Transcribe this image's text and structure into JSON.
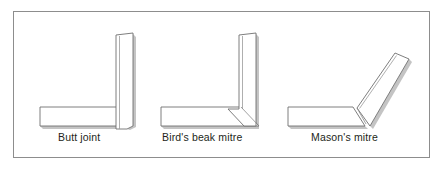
{
  "figure": {
    "background_color": "#ffffff",
    "frame": {
      "name": "figure-border",
      "stroke_color": "#8d8d8d",
      "fill_color": "#ffffff"
    },
    "line_color": "#6f6f6f",
    "shadow_color": "#b8b8b8",
    "shape_fill": "#ffffff",
    "diagrams": [
      {
        "id": "butt-joint",
        "label": "Butt joint",
        "description": "Two rectangular sections meeting at a right angle with square-cut ends",
        "pieces": [
          {
            "name": "horizontal-member",
            "outline": "40,107 117,107 117,126 40,126"
          },
          {
            "name": "vertical-member",
            "outline": "116,35 133,33 133,126 127,129 116,129"
          }
        ]
      },
      {
        "id": "birds-beak-mitre",
        "label": "Bird's beak mitre",
        "description": "Horizontal member cut at 45 degrees meeting a vertical member with a notched beak",
        "pieces": [
          {
            "name": "horizontal-member",
            "outline": "161,107 241,107 259,126 161,126"
          },
          {
            "name": "vertical-member",
            "outline": "239,35 256,33 256,126 244,126 228,109 239,109"
          }
        ]
      },
      {
        "id": "masons-mitre",
        "label": "Mason's mitre",
        "description": "Horizontal member joined to an inclined member at an obtuse angle with a short mitre cut",
        "pieces": [
          {
            "name": "horizontal-member",
            "outline": "288,107 353,107 365,126 288,126"
          },
          {
            "name": "inclined-member",
            "outline": "357,108 395,53 409,59 370,126"
          }
        ]
      }
    ]
  },
  "labels": {
    "butt_joint": "Butt joint",
    "birds_beak_mitre": "Bird's beak mitre",
    "masons_mitre": "Mason's mitre"
  }
}
